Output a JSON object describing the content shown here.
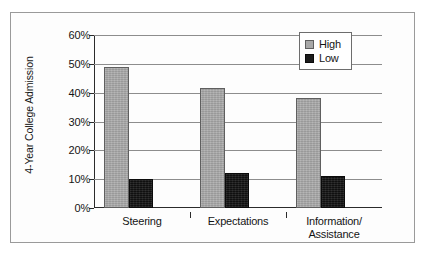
{
  "chart_data": {
    "type": "bar",
    "title": "",
    "subtitle": "",
    "xlabel": "",
    "ylabel": "4-Year College Admission",
    "categories": [
      "Steering",
      "Expectations",
      "Information/\nAssistance"
    ],
    "category_lines": [
      [
        "Steering"
      ],
      [
        "Expectations"
      ],
      [
        "Information/",
        "Assistance"
      ]
    ],
    "series": [
      {
        "name": "High",
        "color": "#a8a8a8",
        "values": [
          49,
          41.5,
          38
        ]
      },
      {
        "name": "Low",
        "color": "#1c1c1c",
        "values": [
          10,
          12,
          11
        ]
      }
    ],
    "ylim": [
      0,
      60
    ],
    "ytick_values": [
      0,
      10,
      20,
      30,
      40,
      50,
      60
    ],
    "ytick_labels": [
      "0%",
      "10%",
      "20%",
      "30%",
      "40%",
      "50%",
      "60%"
    ],
    "grid": true,
    "grid_axis": "y",
    "legend_position": "top-right",
    "value_format": "percent"
  },
  "legend": {
    "entries": [
      {
        "label": "High",
        "swatch": "gray-swatch-icon"
      },
      {
        "label": "Low",
        "swatch": "black-swatch-icon"
      }
    ]
  }
}
